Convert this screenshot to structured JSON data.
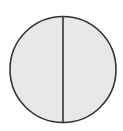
{
  "diagram": {
    "shape": "circle",
    "parts": 2,
    "fill_color": "#e8e8e8",
    "stroke_color": "#333333",
    "background": "#ffffff"
  }
}
